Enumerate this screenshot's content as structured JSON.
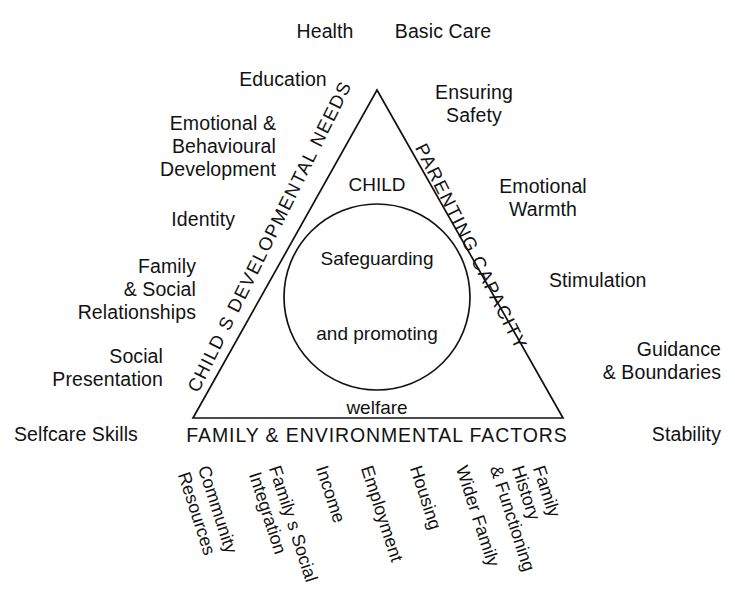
{
  "diagram": {
    "ink_color": "#121212",
    "background": "#ffffff",
    "center": {
      "line1": "CHILD",
      "line2": "Safeguarding",
      "line3": "and promoting",
      "line4": "welfare"
    },
    "sides": {
      "left_heading": "CHILD S DEVELOPMENTAL NEEDS",
      "right_heading": "PARENTING CAPACITY",
      "base_heading": "FAMILY & ENVIRONMENTAL FACTORS"
    },
    "developmental_needs": [
      {
        "label": "Health",
        "x": 325,
        "y": 20,
        "align": "ctr"
      },
      {
        "label": "Education",
        "x": 283,
        "y": 68,
        "align": "ctr"
      },
      {
        "label": "Emotional &\nBehavioural\nDevelopment",
        "x": 276,
        "y": 112,
        "align": "right"
      },
      {
        "label": "Identity",
        "x": 235,
        "y": 208,
        "align": "right"
      },
      {
        "label": "Family\n& Social\nRelationships",
        "x": 196,
        "y": 255,
        "align": "right"
      },
      {
        "label": "Social\nPresentation",
        "x": 163,
        "y": 345,
        "align": "right"
      },
      {
        "label": "Selfcare Skills",
        "x": 14,
        "y": 423,
        "align": "left"
      }
    ],
    "parenting_capacity": [
      {
        "label": "Basic Care",
        "x": 443,
        "y": 20,
        "align": "ctr"
      },
      {
        "label": "Ensuring\nSafety",
        "x": 474,
        "y": 81,
        "align": "ctr"
      },
      {
        "label": "Emotional\nWarmth",
        "x": 543,
        "y": 175,
        "align": "ctr"
      },
      {
        "label": "Stimulation",
        "x": 549,
        "y": 269,
        "align": "left"
      },
      {
        "label": "Guidance\n& Boundaries",
        "x": 721,
        "y": 338,
        "align": "right"
      },
      {
        "label": "Stability",
        "x": 721,
        "y": 423,
        "align": "right"
      }
    ],
    "family_environmental_factors": [
      {
        "line1": "Community",
        "line2": "Resources",
        "x": 211
      },
      {
        "line1": "Family s Social",
        "line2": "Integration",
        "x": 284
      },
      {
        "line1": "Income",
        "line2": "",
        "x": 330
      },
      {
        "line1": "Employment",
        "line2": "",
        "x": 375
      },
      {
        "line1": "Housing",
        "line2": "",
        "x": 424
      },
      {
        "line1": "Wider Family",
        "line2": "",
        "x": 470
      },
      {
        "line1": "Family",
        "line2": "History",
        "x": 546,
        "line3": "& Functioning"
      }
    ],
    "fef_columns": [
      {
        "lines": "Community\nResources",
        "x": 213
      },
      {
        "lines": "Family s Social\nIntegration",
        "x": 284
      },
      {
        "lines": "Income",
        "x": 331
      },
      {
        "lines": "Employment",
        "x": 376
      },
      {
        "lines": "Housing",
        "x": 425
      },
      {
        "lines": "Wider Family",
        "x": 471
      },
      {
        "lines": "& Functioning",
        "x": 505
      },
      {
        "lines": "History",
        "x": 527
      },
      {
        "lines": "Family",
        "x": 548
      }
    ],
    "geometry": {
      "apex_x": 377,
      "apex_y": 90,
      "base_left_x": 193,
      "base_right_x": 563,
      "base_y": 418,
      "circle_cx": 377,
      "circle_cy": 297,
      "circle_r": 93
    }
  }
}
